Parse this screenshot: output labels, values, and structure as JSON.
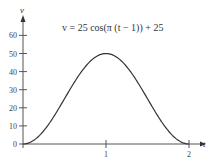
{
  "chart_data": {
    "type": "line",
    "title": "",
    "annotation": "v = 25 cos(π (t − 1)) + 25",
    "xlabel": "t",
    "ylabel": "v",
    "xlim": [
      0,
      2.15
    ],
    "ylim": [
      0,
      65
    ],
    "x_ticks": [
      1,
      2
    ],
    "x_tick_labels": [
      "1",
      "2"
    ],
    "y_ticks": [
      0,
      10,
      20,
      30,
      40,
      50,
      60
    ],
    "y_tick_labels": [
      "0",
      "10",
      "20",
      "30",
      "40",
      "50",
      "60"
    ],
    "grid": false,
    "legend": null,
    "series": [
      {
        "name": "v(t)",
        "function": "25*cos(pi*(t-1))+25",
        "x": [
          0,
          0.1,
          0.2,
          0.3,
          0.4,
          0.5,
          0.6,
          0.7,
          0.8,
          0.9,
          1.0,
          1.1,
          1.2,
          1.3,
          1.4,
          1.5,
          1.6,
          1.7,
          1.8,
          1.9,
          2.0
        ],
        "values": [
          0,
          1.22,
          4.77,
          10.31,
          17.27,
          25,
          32.73,
          39.69,
          45.23,
          48.78,
          50,
          48.78,
          45.23,
          39.69,
          32.73,
          25,
          17.27,
          10.31,
          4.77,
          1.22,
          0
        ]
      }
    ]
  }
}
